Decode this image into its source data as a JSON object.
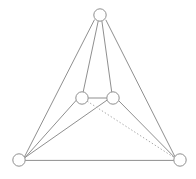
{
  "figure": {
    "kind": "undirected-graph-drawing",
    "width": 196,
    "height": 179,
    "background_color": "#ffffff",
    "node_count": 5,
    "edge_count": 9,
    "labels_visible": false
  },
  "style": {
    "edge_color": "#8f8f8f",
    "edge_color_dotted": "#a8a8a8",
    "edge_width": 1,
    "dotted_dash_pattern": "1.4 2.1",
    "node_stroke_color": "#8f8f8f",
    "node_fill_color": "#ffffff",
    "node_stroke_width": 1,
    "node_radius": 6.2
  },
  "nodes": [
    {
      "id": "apex",
      "name": "node-apex",
      "cx": 100.0,
      "cy": 15.0,
      "r": 6.2
    },
    {
      "id": "mid-left",
      "name": "node-mid-left",
      "cx": 82.0,
      "cy": 98.0,
      "r": 6.2
    },
    {
      "id": "mid-right",
      "name": "node-mid-right",
      "cx": 113.0,
      "cy": 98.0,
      "r": 6.2
    },
    {
      "id": "bottom-left",
      "name": "node-bottom-left",
      "cx": 19.0,
      "cy": 160.0,
      "r": 6.2
    },
    {
      "id": "bottom-right",
      "name": "node-bottom-right",
      "cx": 180.0,
      "cy": 160.0,
      "r": 6.2
    }
  ],
  "edges": [
    {
      "id": "e1",
      "name": "edge-apex-midleft",
      "from": "apex",
      "to": "mid-left",
      "x1": 98.2,
      "y1": 21.1,
      "x2": 83.2,
      "y2": 91.9,
      "style": "solid"
    },
    {
      "id": "e2",
      "name": "edge-apex-midright",
      "from": "apex",
      "to": "mid-right",
      "x1": 101.9,
      "y1": 21.1,
      "x2": 111.7,
      "y2": 91.9,
      "style": "solid"
    },
    {
      "id": "e3",
      "name": "edge-apex-bottomleft",
      "from": "apex",
      "to": "bottom-left",
      "x1": 94.5,
      "y1": 19.6,
      "x2": 24.4,
      "y2": 157.0,
      "style": "solid"
    },
    {
      "id": "e4",
      "name": "edge-apex-bottomright",
      "from": "apex",
      "to": "bottom-right",
      "x1": 105.8,
      "y1": 19.8,
      "x2": 174.9,
      "y2": 156.6,
      "style": "solid"
    },
    {
      "id": "e5",
      "name": "edge-midleft-midright",
      "from": "mid-left",
      "to": "mid-right",
      "x1": 88.2,
      "y1": 98.0,
      "x2": 106.8,
      "y2": 98.0,
      "style": "solid"
    },
    {
      "id": "e6",
      "name": "edge-midleft-bottomleft",
      "from": "mid-left",
      "to": "bottom-left",
      "x1": 76.4,
      "y1": 100.1,
      "x2": 24.8,
      "y2": 157.8,
      "style": "solid"
    },
    {
      "id": "e7",
      "name": "edge-midright-bottomleft",
      "from": "mid-right",
      "to": "bottom-left",
      "x1": 107.1,
      "y1": 100.1,
      "x2": 24.9,
      "y2": 157.6,
      "style": "solid"
    },
    {
      "id": "e8",
      "name": "edge-midright-bottomright",
      "from": "mid-right",
      "to": "bottom-right",
      "x1": 118.6,
      "y1": 100.6,
      "x2": 174.6,
      "y2": 157.4,
      "style": "solid"
    },
    {
      "id": "e9",
      "name": "edge-midleft-bottomright",
      "from": "mid-left",
      "to": "bottom-right",
      "x1": 87.2,
      "y1": 101.2,
      "x2": 174.2,
      "y2": 157.6,
      "style": "dotted"
    },
    {
      "id": "e10",
      "name": "edge-bottomleft-bottomright",
      "from": "bottom-left",
      "to": "bottom-right",
      "x1": 25.2,
      "y1": 160.4,
      "x2": 173.8,
      "y2": 160.4,
      "style": "solid"
    }
  ]
}
